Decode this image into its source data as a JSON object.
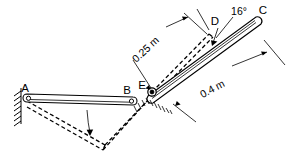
{
  "figure": {
    "background_color": "#ffffff",
    "line_color": "#000000",
    "points": [
      {
        "id": "A",
        "label": "A",
        "x": 25,
        "y": 96,
        "role": "fixed-pin-support"
      },
      {
        "id": "B",
        "label": "B",
        "x": 131,
        "y": 100,
        "role": "pin-joint"
      },
      {
        "id": "E",
        "label": "E",
        "x": 152,
        "y": 91,
        "role": "pin-joint"
      },
      {
        "id": "D",
        "label": "D",
        "x": 212,
        "y": 29,
        "role": "bar-end"
      },
      {
        "id": "C",
        "label": "C",
        "x": 261,
        "y": 22,
        "role": "bar-end"
      }
    ],
    "dimensions": [
      {
        "id": "ED",
        "label": "0.25 m",
        "value": 0.25,
        "unit": "m",
        "from": "E",
        "to": "D",
        "rotation_deg": -43
      },
      {
        "id": "EC",
        "label": "0.4 m",
        "value": 0.4,
        "unit": "m",
        "from": "E",
        "to": "C",
        "rotation_deg": -28
      }
    ],
    "angles": [
      {
        "id": "angle-C",
        "label": "16°",
        "value": 16,
        "unit": "deg",
        "at": "C"
      }
    ],
    "members": [
      {
        "id": "AB",
        "from": "A",
        "to": "B",
        "style": "solid",
        "note": "horizontal bar"
      },
      {
        "id": "EC",
        "from": "E",
        "to": "C",
        "style": "solid",
        "note": "inclined bar"
      },
      {
        "id": "AB-displaced",
        "from": "A",
        "to": "B",
        "style": "dashed",
        "note": "displaced position"
      },
      {
        "id": "ED-displaced",
        "from": "E",
        "to": "D",
        "style": "dashed",
        "note": "displaced position"
      }
    ],
    "motion_arrows": [
      {
        "id": "arrow-AB",
        "note": "rotation of bar AB downward"
      },
      {
        "id": "arrow-D",
        "note": "displacement toward D"
      }
    ]
  }
}
